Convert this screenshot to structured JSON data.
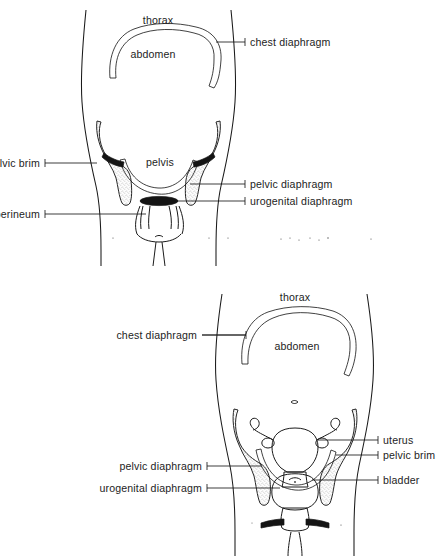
{
  "figure_male": {
    "name": "male-abdominopelvic-diagram",
    "labels": {
      "thorax": "thorax",
      "abdomen": "abdomen",
      "chest_diaphragm": "chest diaphragm",
      "pelvis": "pelvis",
      "pelvic_brim": "pelvic brim",
      "perineum": "perineum",
      "pelvic_diaphragm": "pelvic diaphragm",
      "urogenital_diaphragm": "urogenital diaphragm"
    }
  },
  "figure_female": {
    "name": "female-abdominopelvic-diagram",
    "labels": {
      "thorax": "thorax",
      "abdomen": "abdomen",
      "chest_diaphragm": "chest diaphragm",
      "uterus": "uterus",
      "pelvic_brim": "pelvic brim",
      "bladder": "bladder",
      "pelvic_diaphragm": "pelvic diaphragm",
      "urogenital_diaphragm": "urogenital diaphragm"
    }
  },
  "colors": {
    "background": "#ffffff",
    "ink": "#1a1a1a",
    "text": "#1d1d1d",
    "bone_fill": "#f2f2f2",
    "diaphragm": "#121212"
  }
}
